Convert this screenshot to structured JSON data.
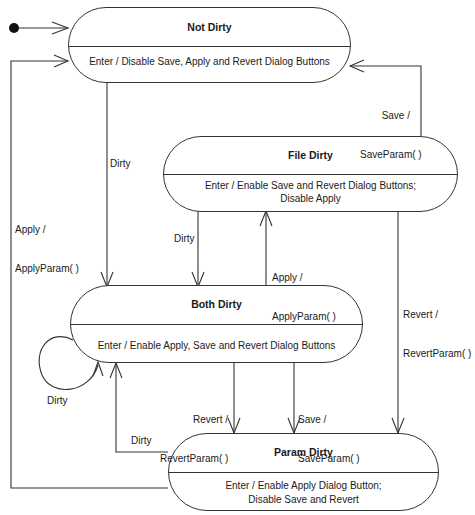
{
  "states": {
    "not_dirty": {
      "name": "Not Dirty",
      "action": "Enter / Disable Save, Apply and Revert Dialog Buttons"
    },
    "file_dirty": {
      "name": "File Dirty",
      "action_line1": "Enter / Enable Save and Revert Dialog Buttons;",
      "action_line2": "Disable Apply"
    },
    "both_dirty": {
      "name": "Both Dirty",
      "action": "Enter / Enable Apply, Save and Revert Dialog Buttons"
    },
    "param_dirty": {
      "name": "Param Dirty",
      "action_line1": "Enter / Enable Apply Dialog Button;",
      "action_line2": "Disable Save  and Revert"
    }
  },
  "transitions": {
    "file_to_not_save": {
      "line1": "Save /",
      "line2": "SaveParam( )"
    },
    "not_to_both_dirty": {
      "label": "Dirty"
    },
    "param_to_not_apply": {
      "line1": "Apply /",
      "line2": "ApplyParam( )"
    },
    "file_to_both_dirty": {
      "label": "Dirty"
    },
    "both_to_file_apply": {
      "line1": "Apply /",
      "line2": "ApplyParam( )"
    },
    "file_to_param_revert": {
      "line1": "Revert /",
      "line2": "RevertParam( )"
    },
    "both_self_dirty": {
      "label": "Dirty"
    },
    "both_to_param_revert": {
      "line1": "Revert /",
      "line2": "RevertParam( )"
    },
    "both_to_param_save": {
      "line1": "Save /",
      "line2": "SaveParam( )"
    },
    "param_to_both_dirty": {
      "label": "Dirty"
    }
  }
}
